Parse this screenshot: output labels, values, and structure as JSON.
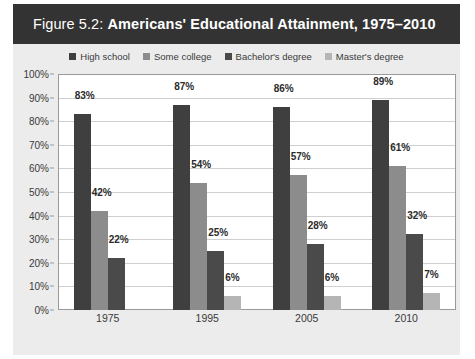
{
  "title": {
    "prefix": "Figure 5.2: ",
    "main": "Americans' Educational Attainment, 1975–2010",
    "full": "Figure 5.2: Americans' Educational Attainment, 1975–2010"
  },
  "colors": {
    "title_bar": "#333333",
    "panel_background": "#ececec",
    "plot_background": "#ffffff",
    "gridline": "#cfcfcf",
    "axis_line": "#9a9a9a",
    "text": "#3a3a3a",
    "label_text": "#2b2b2b"
  },
  "chart_data": {
    "type": "bar",
    "title": "Figure 5.2: Americans' Educational Attainment, 1975–2010",
    "xlabel": "",
    "ylabel": "",
    "categories": [
      "1975",
      "1995",
      "2005",
      "2010"
    ],
    "ylim": [
      0,
      100
    ],
    "ytick_labels": [
      "0%",
      "10%",
      "20%",
      "30%",
      "40%",
      "50%",
      "60%",
      "70%",
      "80%",
      "90%",
      "100%"
    ],
    "ytick_values": [
      0,
      10,
      20,
      30,
      40,
      50,
      60,
      70,
      80,
      90,
      100
    ],
    "grid": true,
    "legend_position": "top-center",
    "value_suffix": "%",
    "series": [
      {
        "name": "High school",
        "color": "#3f3f3f",
        "values": [
          83,
          87,
          86,
          89
        ],
        "labels": [
          "83%",
          "87%",
          "86%",
          "89%"
        ]
      },
      {
        "name": "Some college",
        "color": "#8c8c8c",
        "values": [
          42,
          54,
          57,
          61
        ],
        "labels": [
          "42%",
          "54%",
          "57%",
          "61%"
        ]
      },
      {
        "name": "Bachelor's degree",
        "color": "#4a4a4a",
        "values": [
          22,
          25,
          28,
          32
        ],
        "labels": [
          "22%",
          "25%",
          "28%",
          "32%"
        ]
      },
      {
        "name": "Master's degree",
        "color": "#b5b5b5",
        "values": [
          null,
          6,
          6,
          7
        ],
        "labels": [
          "",
          "6%",
          "6%",
          "7%"
        ]
      }
    ]
  }
}
